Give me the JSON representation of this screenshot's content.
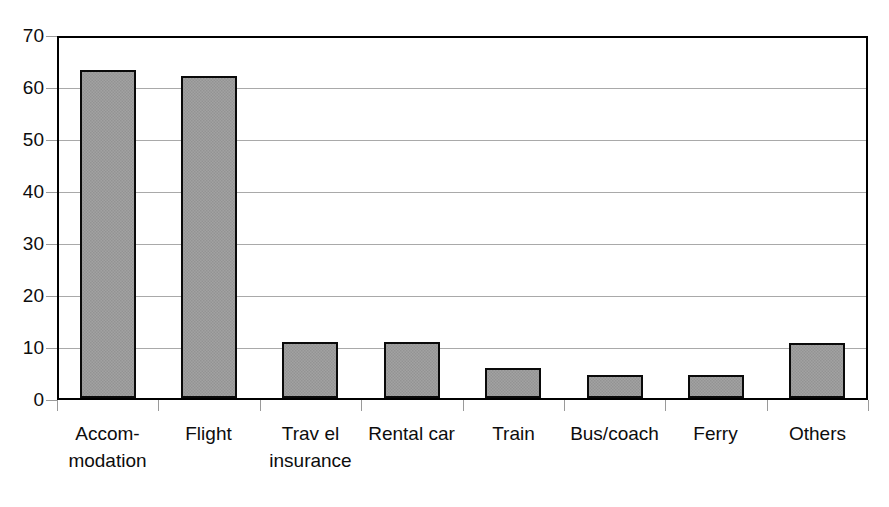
{
  "chart_data": {
    "type": "bar",
    "title": "",
    "subtitle": "",
    "xlabel": "",
    "ylabel": "",
    "categories": [
      "Accom-\nmodation",
      "Flight",
      "Trav el\ninsurance",
      "Rental car",
      "Train",
      "Bus/coach",
      "Ferry",
      "Others"
    ],
    "category_lines": [
      [
        "Accom-",
        "modation"
      ],
      [
        "Flight",
        ""
      ],
      [
        "Trav el",
        "insurance"
      ],
      [
        "Rental car",
        ""
      ],
      [
        "Train",
        ""
      ],
      [
        "Bus/coach",
        ""
      ],
      [
        "Ferry",
        ""
      ],
      [
        "Others",
        ""
      ]
    ],
    "values": [
      63,
      62,
      10.8,
      10.8,
      5.8,
      4.5,
      4.5,
      10.6
    ],
    "ylim": [
      0,
      70
    ],
    "yticks": [
      0,
      10,
      20,
      30,
      40,
      50,
      60,
      70
    ],
    "ytick_labels": [
      "0",
      "10",
      "20",
      "30",
      "40",
      "50",
      "60",
      "70"
    ],
    "grid": true,
    "legend": null,
    "bar_fill_color": "#9b9b9b",
    "bar_border_color": "#0a0a0a",
    "axis_color": "#000000",
    "gridline_color": "#9a9a9a",
    "text_color": "#0d0d0d"
  }
}
